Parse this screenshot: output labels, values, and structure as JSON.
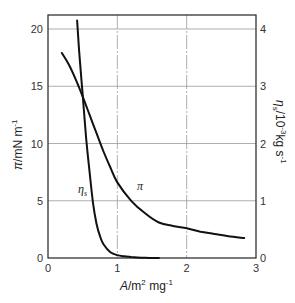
{
  "chart_data": {
    "type": "line",
    "title": "",
    "xlabel": "A / m² mg⁻¹",
    "ylabel_left": "π / mN m⁻¹",
    "ylabel_right": "ηs / 10⁻³ kg s⁻¹",
    "xlim": [
      0,
      3
    ],
    "ylim_left": [
      0,
      20
    ],
    "ylim_right": [
      0,
      4
    ],
    "x_ticks": [
      "0",
      "1",
      "2",
      "3"
    ],
    "y_ticks_left": [
      "0",
      "5",
      "10",
      "15",
      "20"
    ],
    "y_ticks_right": [
      "0",
      "1",
      "2",
      "3",
      "4"
    ],
    "grid": true,
    "legend": "inline curve labels",
    "series": [
      {
        "name": "π",
        "axis": "left",
        "label_text": "π",
        "x": [
          0.2,
          0.3,
          0.4,
          0.5,
          0.6,
          0.7,
          0.8,
          0.9,
          1.0,
          1.2,
          1.4,
          1.6,
          1.8,
          2.0,
          2.2,
          2.4,
          2.6,
          2.83
        ],
        "y": [
          17.9,
          16.9,
          15.6,
          14.1,
          12.5,
          10.9,
          9.3,
          7.9,
          6.6,
          5.0,
          3.9,
          3.1,
          2.8,
          2.6,
          2.3,
          2.1,
          1.9,
          1.75
        ]
      },
      {
        "name": "ηs",
        "axis": "right",
        "label_text": "ηs",
        "x": [
          0.42,
          0.45,
          0.5,
          0.55,
          0.6,
          0.65,
          0.7,
          0.75,
          0.8,
          0.9,
          1.0,
          1.1,
          1.2,
          1.3,
          1.4,
          1.6
        ],
        "y": [
          4.15,
          3.6,
          2.85,
          2.1,
          1.5,
          0.95,
          0.6,
          0.38,
          0.24,
          0.1,
          0.05,
          0.03,
          0.02,
          0.01,
          0.005,
          0.0
        ]
      }
    ]
  }
}
